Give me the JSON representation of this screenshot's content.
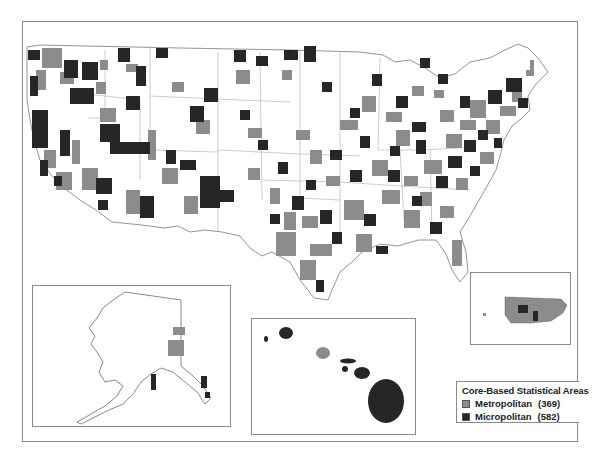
{
  "map": {
    "subject": "Core-Based Statistical Areas of the United States",
    "colors": {
      "metropolitan": "#8c8c8c",
      "micropolitan": "#262626",
      "none": "#ffffff",
      "outline": "#7a7a7a"
    },
    "insets": [
      {
        "name": "Alaska"
      },
      {
        "name": "Hawaii"
      },
      {
        "name": "Puerto Rico"
      }
    ]
  },
  "legend": {
    "title": "Core-Based Statistical Areas",
    "items": [
      {
        "label": "Metropolitan",
        "count": "(369)",
        "color": "#8c8c8c"
      },
      {
        "label": "Micropolitan",
        "count": "(582)",
        "color": "#262626"
      }
    ]
  }
}
